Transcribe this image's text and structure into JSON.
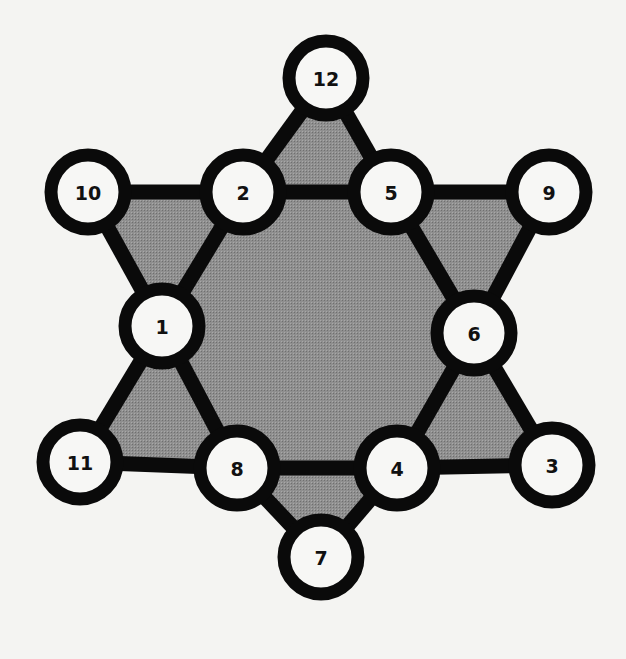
{
  "diagram": {
    "type": "magic-star-puzzle",
    "colors": {
      "background": "#f4f4f2",
      "fill": "#8c8c8c",
      "stroke": "#0a0a0a",
      "node_fill": "#f7f7f5"
    },
    "nodes": [
      {
        "id": "12",
        "label": "12",
        "x": 326,
        "y": 78
      },
      {
        "id": "10",
        "label": "10",
        "x": 88,
        "y": 192
      },
      {
        "id": "2",
        "label": "2",
        "x": 243,
        "y": 192
      },
      {
        "id": "5",
        "label": "5",
        "x": 391,
        "y": 192
      },
      {
        "id": "9",
        "label": "9",
        "x": 549,
        "y": 192
      },
      {
        "id": "1",
        "label": "1",
        "x": 162,
        "y": 326
      },
      {
        "id": "6",
        "label": "6",
        "x": 474,
        "y": 333
      },
      {
        "id": "11",
        "label": "11",
        "x": 80,
        "y": 462
      },
      {
        "id": "8",
        "label": "8",
        "x": 237,
        "y": 468
      },
      {
        "id": "4",
        "label": "4",
        "x": 397,
        "y": 468
      },
      {
        "id": "3",
        "label": "3",
        "x": 552,
        "y": 465
      },
      {
        "id": "7",
        "label": "7",
        "x": 321,
        "y": 557
      }
    ],
    "edges": [
      [
        "12",
        "2"
      ],
      [
        "12",
        "5"
      ],
      [
        "10",
        "2"
      ],
      [
        "2",
        "5"
      ],
      [
        "5",
        "9"
      ],
      [
        "10",
        "1"
      ],
      [
        "2",
        "1"
      ],
      [
        "9",
        "6"
      ],
      [
        "5",
        "6"
      ],
      [
        "1",
        "11"
      ],
      [
        "1",
        "8"
      ],
      [
        "6",
        "4"
      ],
      [
        "6",
        "3"
      ],
      [
        "11",
        "8"
      ],
      [
        "8",
        "4"
      ],
      [
        "4",
        "3"
      ],
      [
        "8",
        "7"
      ],
      [
        "4",
        "7"
      ]
    ],
    "shaded_regions": [
      [
        "2",
        "5",
        "6",
        "4",
        "8",
        "1"
      ],
      [
        "12",
        "2",
        "5"
      ],
      [
        "10",
        "2",
        "1"
      ],
      [
        "5",
        "9",
        "6"
      ],
      [
        "1",
        "11",
        "8"
      ],
      [
        "6",
        "4",
        "3"
      ],
      [
        "8",
        "4",
        "7"
      ]
    ]
  }
}
